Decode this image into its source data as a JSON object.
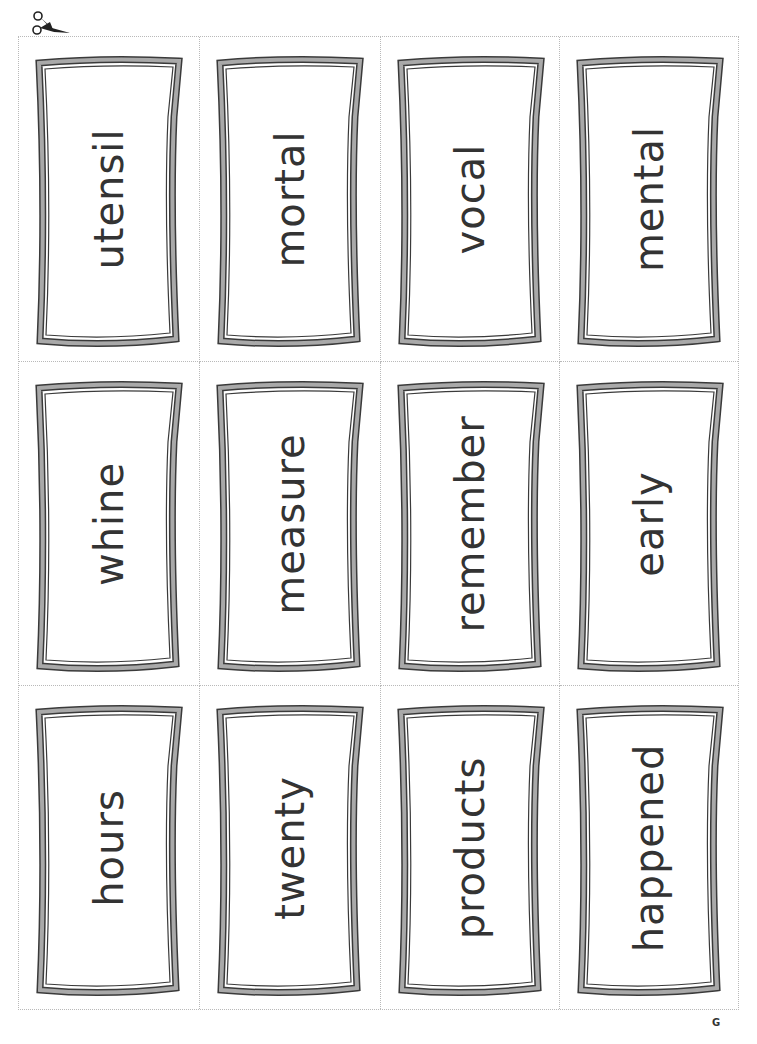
{
  "page": {
    "cut_marker_icon": "scissors-icon",
    "page_letter": "G"
  },
  "colors": {
    "frame_fill": "#a9a9a9",
    "frame_outline": "#3a3a3a",
    "text": "#333333",
    "cut_line": "#b9b9b9"
  },
  "cards": {
    "row1": [
      "utensil",
      "mortal",
      "vocal",
      "mental"
    ],
    "row2": [
      "whine",
      "measure",
      "remember",
      "early"
    ],
    "row3": [
      "hours",
      "twenty",
      "products",
      "happened"
    ]
  }
}
